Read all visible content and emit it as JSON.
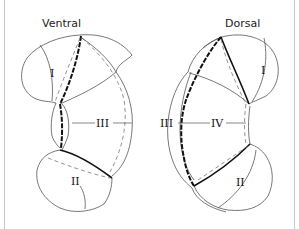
{
  "figure": {
    "ventral": {
      "title": "Ventral",
      "labels": {
        "I": "I",
        "II": "II",
        "III": "III"
      }
    },
    "dorsal": {
      "title": "Dorsal",
      "labels": {
        "I": "I",
        "II": "II",
        "III": "III",
        "IV": "IV"
      }
    }
  },
  "colors": {
    "background": "#ffffff",
    "line": "#555555",
    "bold_line": "#111111",
    "frame": "#c8c8c8"
  }
}
